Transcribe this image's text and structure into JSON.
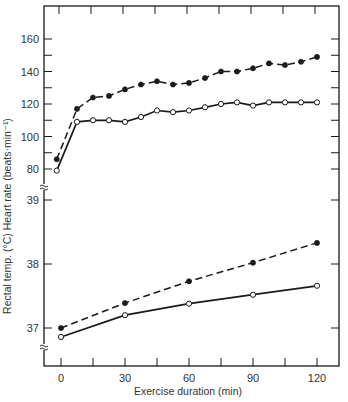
{
  "chart_data": [
    {
      "type": "line",
      "panel": "heart_rate",
      "title": "",
      "xlabel": "Exercise duration (min)",
      "ylabel": "Heart rate (beats·min⁻¹)",
      "xlim": [
        -7,
        130
      ],
      "ylim": [
        72,
        170
      ],
      "yticks": [
        80,
        100,
        120,
        140,
        160
      ],
      "grid": false,
      "legend": "none",
      "x": [
        -2,
        7.5,
        15,
        22.5,
        30,
        37.5,
        45,
        52.5,
        60,
        67.5,
        75,
        82.5,
        90,
        97.5,
        105,
        112.5,
        120
      ],
      "series": [
        {
          "name": "closed circles (dashed)",
          "marker": "filled-circle",
          "line": "dashed",
          "values": [
            86,
            117,
            124,
            125,
            129,
            132,
            134,
            132,
            133,
            136,
            140,
            140,
            142,
            145,
            144,
            146,
            149
          ]
        },
        {
          "name": "open circles (solid)",
          "marker": "open-circle",
          "line": "solid",
          "values": [
            79,
            109,
            110,
            110,
            109,
            112,
            116,
            115,
            116,
            118,
            120,
            121,
            119,
            121,
            121,
            121,
            121
          ]
        }
      ]
    },
    {
      "type": "line",
      "panel": "rectal_temperature",
      "title": "",
      "xlabel": "Exercise duration (min)",
      "ylabel": "Rectal temp. (°C)",
      "xlim": [
        -7,
        130
      ],
      "ylim": [
        36.6,
        39.3
      ],
      "yticks": [
        37,
        38,
        39
      ],
      "grid": false,
      "legend": "none",
      "x": [
        0,
        30,
        60,
        90,
        120
      ],
      "series": [
        {
          "name": "closed circles (dashed)",
          "marker": "filled-circle",
          "line": "dashed",
          "values": [
            37.0,
            37.39,
            37.73,
            38.02,
            38.33
          ]
        },
        {
          "name": "open circles (solid)",
          "marker": "open-circle",
          "line": "solid",
          "values": [
            36.86,
            37.2,
            37.38,
            37.52,
            37.66
          ]
        }
      ]
    }
  ],
  "axes": {
    "x_label": "Exercise duration (min)",
    "y_label": "Rectal temp. (°C) Heart rate (beats·min⁻¹)",
    "x_ticks": [
      "0",
      "30",
      "60",
      "90",
      "120"
    ],
    "hr_ticks": [
      "160",
      "140",
      "120",
      "100",
      "80"
    ],
    "temp_ticks": [
      "39",
      "38",
      "37"
    ],
    "axis_break_symbol": "≈"
  },
  "colors": {
    "ink": "#1a1a1a",
    "text": "#333333",
    "background": "#ffffff"
  }
}
